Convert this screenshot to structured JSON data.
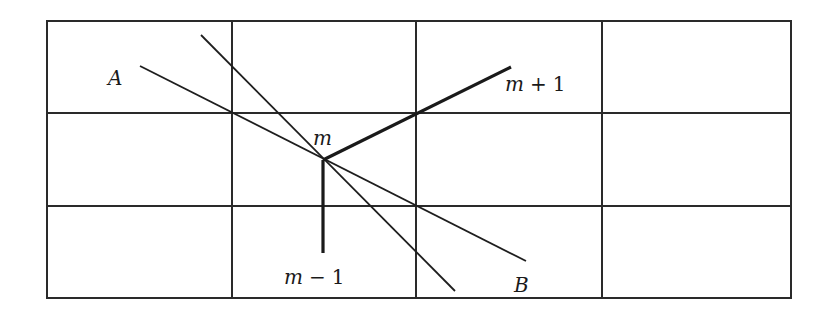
{
  "diagram": {
    "grid": {
      "columns": 4,
      "rows": 3
    },
    "labels": {
      "A": "A",
      "B": "B",
      "m": "m",
      "m_plus_1": {
        "var": "m",
        "op": "+",
        "num": "1"
      },
      "m_minus_1": {
        "var": "m",
        "op": "−",
        "num": "1"
      }
    },
    "lines": [
      {
        "name": "line-A-B",
        "from": "A",
        "to": "B"
      },
      {
        "name": "steep-line",
        "description": "second thin line crossing node m"
      },
      {
        "name": "edge-m-to-m-plus-1",
        "from": "m",
        "to": "m+1",
        "style": "thick"
      },
      {
        "name": "edge-m-to-m-minus-1",
        "from": "m",
        "to": "m-1",
        "style": "thick"
      }
    ]
  }
}
